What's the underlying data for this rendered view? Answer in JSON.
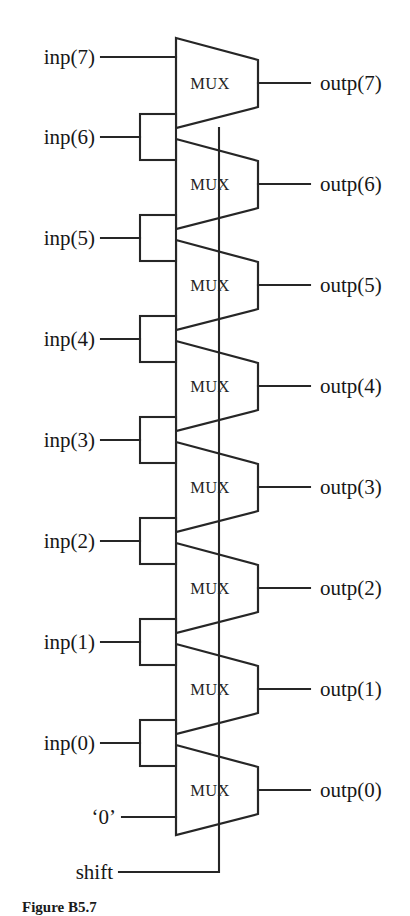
{
  "figure": {
    "caption": "Figure B5.7",
    "background_color": "#ffffff",
    "line_color": "#262626",
    "text_color": "#171717"
  },
  "select_signal": {
    "label": "shift",
    "description": "common select line routed up through all MUX stages"
  },
  "constant_input": {
    "label": "‘0’",
    "description": "logic zero fed into the lowest MUX data input"
  },
  "mux": {
    "label": "MUX",
    "count": 8
  },
  "inputs": [
    {
      "label": "inp(7)"
    },
    {
      "label": "inp(6)"
    },
    {
      "label": "inp(5)"
    },
    {
      "label": "inp(4)"
    },
    {
      "label": "inp(3)"
    },
    {
      "label": "inp(2)"
    },
    {
      "label": "inp(1)"
    },
    {
      "label": "inp(0)"
    }
  ],
  "outputs": [
    {
      "label": "outp(7)"
    },
    {
      "label": "outp(6)"
    },
    {
      "label": "outp(5)"
    },
    {
      "label": "outp(4)"
    },
    {
      "label": "outp(3)"
    },
    {
      "label": "outp(2)"
    },
    {
      "label": "outp(1)"
    },
    {
      "label": "outp(0)"
    }
  ],
  "stages": [
    {
      "mux_label": "MUX",
      "input_label": "inp(7)",
      "output_label": "outp(7)"
    },
    {
      "mux_label": "MUX",
      "input_label": "inp(6)",
      "output_label": "outp(6)"
    },
    {
      "mux_label": "MUX",
      "input_label": "inp(5)",
      "output_label": "outp(5)"
    },
    {
      "mux_label": "MUX",
      "input_label": "inp(4)",
      "output_label": "outp(4)"
    },
    {
      "mux_label": "MUX",
      "input_label": "inp(3)",
      "output_label": "outp(3)"
    },
    {
      "mux_label": "MUX",
      "input_label": "inp(2)",
      "output_label": "outp(2)"
    },
    {
      "mux_label": "MUX",
      "input_label": "inp(1)",
      "output_label": "outp(1)"
    },
    {
      "mux_label": "MUX",
      "input_label": "inp(0)",
      "output_label": "outp(0)"
    }
  ]
}
